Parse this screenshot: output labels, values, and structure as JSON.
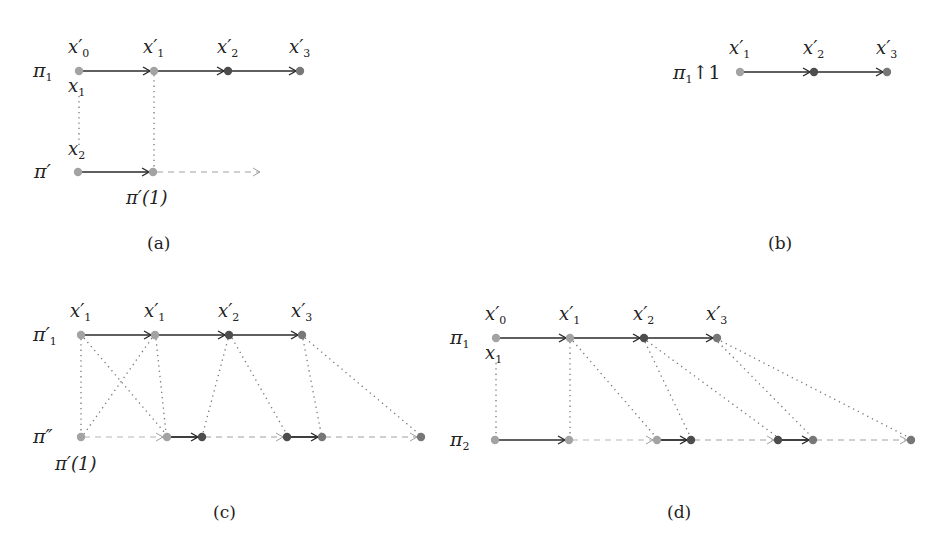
{
  "colors": {
    "light": "#a3a3a3",
    "mid": "#777777",
    "dark": "#4d4d4d",
    "edge": "#2a2a2a",
    "dotted": "#777777",
    "dashed": "#a8a8a8"
  },
  "panels": [
    {
      "id": "a",
      "caption": "(a)",
      "row_labels": [
        {
          "text": "π₁"
        },
        {
          "text": "π′"
        }
      ],
      "node_labels": [
        "x′₀",
        "x′₁",
        "x′₂",
        "x′₃",
        "x₁",
        "x₂"
      ],
      "bottom_label": "π′(1)"
    },
    {
      "id": "b",
      "caption": "(b)",
      "row_labels": [
        {
          "text": "π₁↑1"
        }
      ],
      "node_labels": [
        "x′₁",
        "x′₂",
        "x′₃"
      ]
    },
    {
      "id": "c",
      "caption": "(c)",
      "row_labels": [
        {
          "text": "π′₁"
        },
        {
          "text": "π″"
        }
      ],
      "node_labels": [
        "x′₁",
        "x′₁",
        "x′₂",
        "x′₃"
      ],
      "bottom_label": "π′(1)"
    },
    {
      "id": "d",
      "caption": "(d)",
      "row_labels": [
        {
          "text": "π₁"
        },
        {
          "text": "π₂"
        }
      ],
      "node_labels": [
        "x′₀",
        "x′₁",
        "x′₂",
        "x′₃",
        "x₁"
      ]
    }
  ]
}
